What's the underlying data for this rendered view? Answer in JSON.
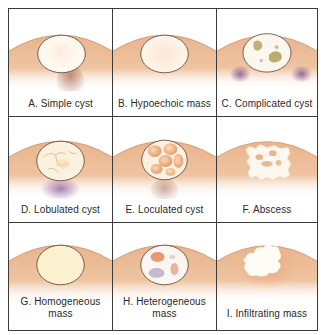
{
  "figure": {
    "colors": {
      "tissue": "#eab892",
      "tissue_light": "#f5dcc8",
      "lesion_fill": "#fffaf2",
      "outline": "#6b5040",
      "shadow_purple": "#8a5a8f",
      "accent_orange": "#e08a50",
      "debris_olive": "#9a8a40",
      "border": "#3a3a3a"
    },
    "panels": [
      {
        "id": "A",
        "label": "A. Simple cyst",
        "feature": "anechoic oval with posterior enhancement"
      },
      {
        "id": "B",
        "label": "B. Hypoechoic mass",
        "feature": "uniform oval lesion"
      },
      {
        "id": "C",
        "label": "C. Complicated cyst",
        "feature": "internal debris, lateral shadowing"
      },
      {
        "id": "D",
        "label": "D. Lobulated cyst",
        "feature": "thin internal septations"
      },
      {
        "id": "E",
        "label": "E. Loculated cyst",
        "feature": "multiple loculations"
      },
      {
        "id": "F",
        "label": "F. Abscess",
        "feature": "irregular margin, internal echoes"
      },
      {
        "id": "G",
        "label": "G. Homogeneous mass",
        "label_lines": [
          "G. Homogeneous",
          "mass"
        ],
        "feature": "uniform cream fill"
      },
      {
        "id": "H",
        "label": "H. Heterogeneous mass",
        "label_lines": [
          "H. Heterogeneous",
          "mass"
        ],
        "feature": "mixed internal echoes"
      },
      {
        "id": "I",
        "label": "I. Infiltrating mass",
        "feature": "lobulated irregular margin"
      }
    ]
  }
}
